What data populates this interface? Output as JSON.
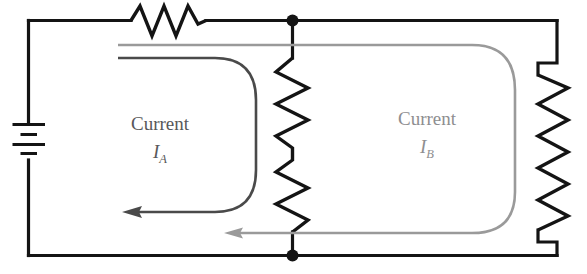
{
  "figure": {
    "name": "two-loop-resistor-circuit",
    "background_color": "#ffffff"
  },
  "colors": {
    "wire": "#141414",
    "loop_a": "#4a4a4a",
    "loop_b": "#9a9a9a",
    "label_a": "#58585a",
    "label_b": "#8e8e90"
  },
  "labels": {
    "loop_a": {
      "word": "Current",
      "symbol": "I",
      "subscript": "A"
    },
    "loop_b": {
      "word": "Current",
      "symbol": "I",
      "subscript": "B"
    }
  },
  "components": {
    "battery": {
      "name": "battery",
      "cells": 2,
      "orientation": "vertical"
    },
    "resistor_top": {
      "name": "resistor-top",
      "orientation": "horizontal"
    },
    "resistor_middle": {
      "name": "resistor-middle",
      "orientation": "vertical"
    },
    "resistor_right": {
      "name": "resistor-right",
      "orientation": "vertical"
    },
    "node_top": {
      "name": "junction-node-top"
    },
    "node_bottom": {
      "name": "junction-node-bottom"
    }
  },
  "loops": {
    "loop_a": {
      "name": "current-loop-a",
      "direction": "counterclockwise",
      "arrow_direction": "left"
    },
    "loop_b": {
      "name": "current-loop-b",
      "direction": "counterclockwise",
      "arrow_direction": "left"
    }
  }
}
